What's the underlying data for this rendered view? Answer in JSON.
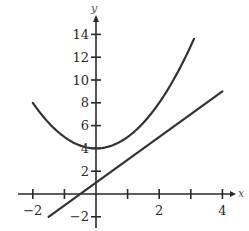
{
  "chart_data": {
    "type": "line",
    "title": "",
    "xlabel": "x",
    "ylabel": "y",
    "xlim": [
      -2.2,
      4.5
    ],
    "ylim": [
      -3,
      15.5
    ],
    "grid": false,
    "legend": null,
    "x_ticks": [
      -2,
      -1,
      0,
      1,
      2,
      3,
      4
    ],
    "x_tick_labels": [
      "−2",
      "",
      "",
      "",
      "2",
      "",
      "4"
    ],
    "y_ticks": [
      -2,
      2,
      4,
      6,
      8,
      10,
      12,
      14
    ],
    "y_tick_labels": [
      "−2",
      "2",
      "4",
      "6",
      "8",
      "10",
      "12",
      "14"
    ],
    "series": [
      {
        "name": "parabola",
        "formula": "y = x^2 + 4",
        "x": [
          -2,
          -1.5,
          -1,
          -0.5,
          0,
          0.5,
          1,
          1.5,
          2,
          2.5,
          3,
          3.1
        ],
        "y": [
          8,
          6.25,
          5,
          4.25,
          4,
          4.25,
          5,
          6.25,
          8,
          10.25,
          13,
          13.61
        ]
      },
      {
        "name": "line",
        "formula": "y = 2x + 1",
        "x": [
          -1.5,
          0,
          4
        ],
        "y": [
          -2,
          1,
          9
        ]
      }
    ]
  },
  "axes": {
    "x_label": "x",
    "y_label": "y"
  }
}
